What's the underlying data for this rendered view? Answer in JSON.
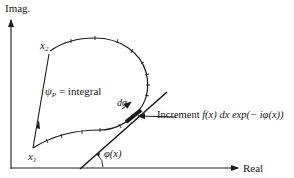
{
  "axes": {
    "y_label": "Imag.",
    "x_label": "Real"
  },
  "points": {
    "start": {
      "symbol": "x",
      "subscript": "1"
    },
    "end": {
      "symbol": "x",
      "subscript": "2"
    }
  },
  "labels": {
    "psi": "ψ",
    "psi_sub": "P",
    "psi_rest": " = integral",
    "dsigma": "dσ",
    "increment_word": "Increment ",
    "increment_formula": "f(x) dx exp(− iφ(x))",
    "angle": "φ(x)"
  },
  "colors": {
    "ink": "#1a1a1a",
    "background": "#ffffff"
  }
}
